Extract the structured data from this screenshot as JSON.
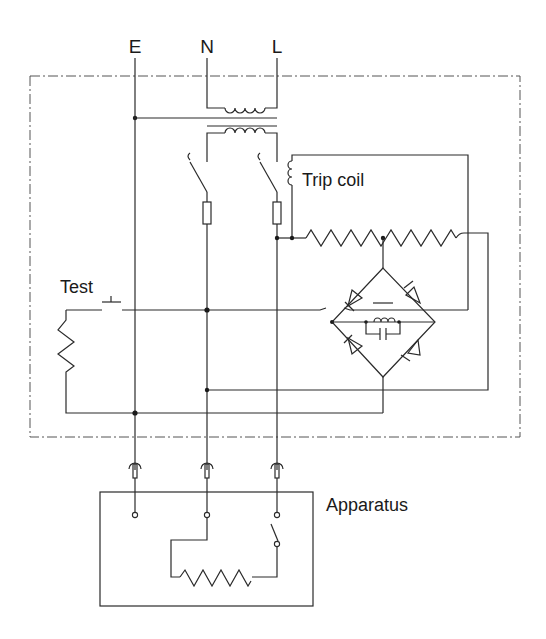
{
  "diagram": {
    "type": "circuit-schematic",
    "terminals": {
      "earth": "E",
      "neutral": "N",
      "live": "L"
    },
    "labels": {
      "trip_coil": "Trip coil",
      "test": "Test",
      "apparatus": "Apparatus"
    },
    "components": [
      {
        "id": "transformer",
        "name": "Core balance transformer",
        "between": [
          "N",
          "L"
        ]
      },
      {
        "id": "switch-n",
        "name": "Neutral contact switch"
      },
      {
        "id": "switch-l",
        "name": "Live contact switch"
      },
      {
        "id": "fuse-n",
        "name": "Neutral fuse"
      },
      {
        "id": "fuse-l",
        "name": "Live fuse"
      },
      {
        "id": "trip-coil",
        "name": "Trip coil"
      },
      {
        "id": "resistor-1",
        "name": "Series resistor (left)"
      },
      {
        "id": "resistor-2",
        "name": "Series resistor (right)"
      },
      {
        "id": "bridge",
        "name": "Diode bridge rectifier",
        "diodes": 4
      },
      {
        "id": "coil-capacitor",
        "name": "Inductor with parallel capacitor"
      },
      {
        "id": "test-button",
        "name": "Test push button"
      },
      {
        "id": "test-resistor",
        "name": "Test resistor"
      },
      {
        "id": "plugs",
        "name": "Plug connectors",
        "count": 3
      },
      {
        "id": "apparatus-switch",
        "name": "Apparatus switch"
      },
      {
        "id": "apparatus-heater",
        "name": "Apparatus load resistor"
      }
    ],
    "colors": {
      "line": "#2a2a2a",
      "background": "#ffffff",
      "boundary": "#555555"
    }
  }
}
